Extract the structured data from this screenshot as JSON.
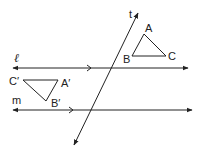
{
  "diagram": {
    "colors": {
      "stroke": "#222222",
      "background": "#ffffff"
    },
    "lines": {
      "l": {
        "label": "ℓ",
        "y": 68,
        "x1": 13,
        "x2": 188,
        "parallel_mark_x": 90
      },
      "m": {
        "label": "m",
        "y": 110,
        "x1": 13,
        "x2": 192,
        "parallel_mark_x": 72
      },
      "t": {
        "label": "t",
        "top": [
          138,
          13
        ],
        "bottom": [
          74,
          145
        ]
      }
    },
    "triangles": {
      "original": {
        "vertices": {
          "A": {
            "label": "A",
            "x": 144,
            "y": 34
          },
          "B": {
            "label": "B",
            "x": 132,
            "y": 56
          },
          "C": {
            "label": "C",
            "x": 166,
            "y": 56
          }
        }
      },
      "image": {
        "vertices": {
          "A_prime": {
            "label": "A′",
            "x": 58,
            "y": 80
          },
          "B_prime": {
            "label": "B′",
            "x": 46,
            "y": 101
          },
          "C_prime": {
            "label": "C′",
            "x": 23,
            "y": 80
          }
        }
      }
    }
  }
}
